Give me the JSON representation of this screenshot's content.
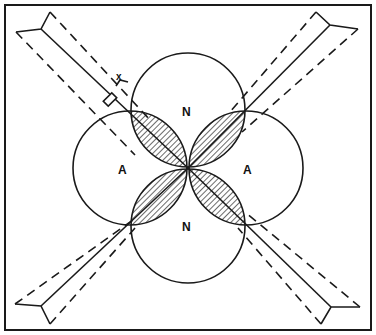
{
  "diagram": {
    "labels": {
      "n_top": "N",
      "n_bottom": "N",
      "a_left": "A",
      "a_right": "A",
      "marker": "x"
    },
    "colors": {
      "line": "#1a1a1a",
      "background": "#ffffff"
    },
    "elements": {
      "circles": 4,
      "hatched_lobes": 4,
      "diagonal_beams": 4
    }
  }
}
